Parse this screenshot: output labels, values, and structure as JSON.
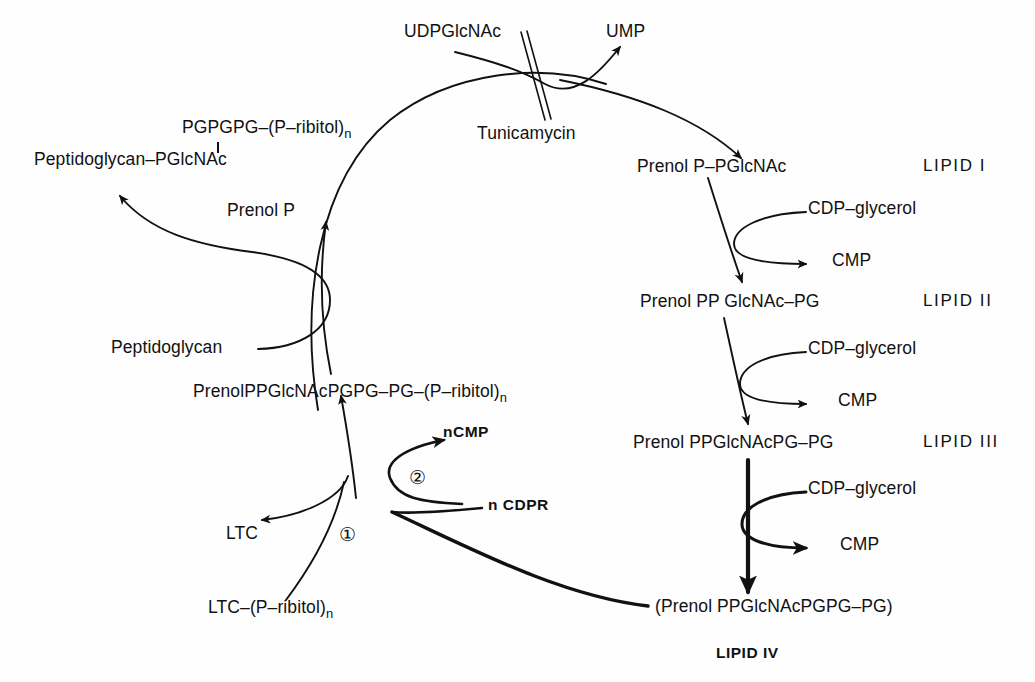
{
  "diagram": {
    "background_color": "#fefefe",
    "stroke_color": "#111111"
  },
  "labels": {
    "udpglcnac": "UDPGlcNAc",
    "ump": "UMP",
    "tunicamycin": "Tunicamycin",
    "pgpgpg_ribitol": "PGPGPG–(P–ribitol)",
    "pgpgpg_ribitol_sub": "n",
    "peptidoglycan_pglcnac": "Peptidoglycan–PGlcNAc",
    "prenol_p": "Prenol P",
    "peptidoglycan": "Peptidoglycan",
    "central_intermediate": "PrenolPPGlcNAcPGPG–PG–(P–ribitol)",
    "central_intermediate_sub": "n",
    "ltc": "LTC",
    "ltc_ribitol": "LTC–(P–ribitol)",
    "ltc_ribitol_sub": "n",
    "ncmp": "nCMP",
    "ncdpr": "n CDPR",
    "step_one": "①",
    "step_two": "②",
    "lipid_i_name": "Prenol P–PGlcNAc",
    "lipid_ii_name": "Prenol PP GlcNAc–PG",
    "lipid_iii_name": "Prenol PPGlcNAcPG–PG",
    "lipid_iv_name": "(Prenol PPGlcNAcPGPG–PG)",
    "lipid_i_tag": "LIPID I",
    "lipid_ii_tag": "LIPID II",
    "lipid_iii_tag": "LIPID III",
    "lipid_iv_tag": "LIPID IV",
    "cdp_glycerol_1": "CDP–glycerol",
    "cdp_glycerol_2": "CDP–glycerol",
    "cdp_glycerol_3": "CDP–glycerol",
    "cmp_1": "CMP",
    "cmp_2": "CMP",
    "cmp_3": "CMP"
  }
}
